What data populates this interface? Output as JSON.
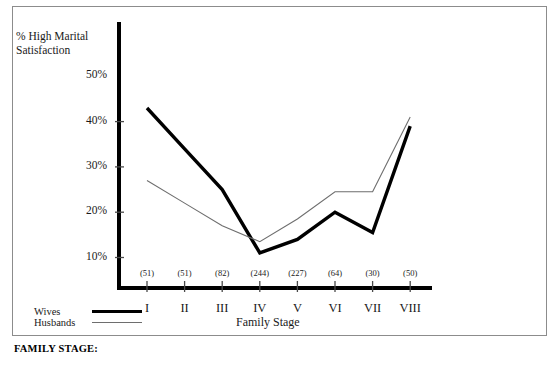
{
  "figure": {
    "y_axis_title": "% High Marital\nSatisfaction",
    "x_axis_title": "Family Stage"
  },
  "legend": {
    "entries": [
      {
        "name": "Wives",
        "style": "thick",
        "swatch": "thick-line-swatch"
      },
      {
        "name": "Husbands",
        "style": "thin",
        "swatch": "thin-line-swatch"
      }
    ]
  },
  "caption": {
    "heading": "FAMILY STAGE:",
    "body": ""
  },
  "chart_data": {
    "type": "line",
    "title": "",
    "xlabel": "Family Stage",
    "ylabel": "% High Marital Satisfaction",
    "categories": [
      "I",
      "II",
      "III",
      "IV",
      "V",
      "VI",
      "VII",
      "VIII"
    ],
    "sample_sizes": [
      "(51)",
      "(51)",
      "(82)",
      "(244)",
      "(227)",
      "(64)",
      "(30)",
      "(50)"
    ],
    "ylim": [
      0,
      55
    ],
    "yticks": [
      10,
      20,
      30,
      40,
      50
    ],
    "ytick_labels": [
      "10%",
      "20%",
      "30%",
      "40%",
      "50%"
    ],
    "grid": false,
    "legend_position": "bottom-left",
    "series": [
      {
        "name": "Wives",
        "style": "thick",
        "color": "#000000",
        "values": [
          43,
          34,
          25,
          11,
          14,
          20,
          15.5,
          39
        ]
      },
      {
        "name": "Husbands",
        "style": "thin",
        "color": "#6e6e6e",
        "values": [
          27,
          22,
          17,
          13.5,
          18.5,
          24.5,
          24.5,
          41
        ]
      }
    ]
  }
}
